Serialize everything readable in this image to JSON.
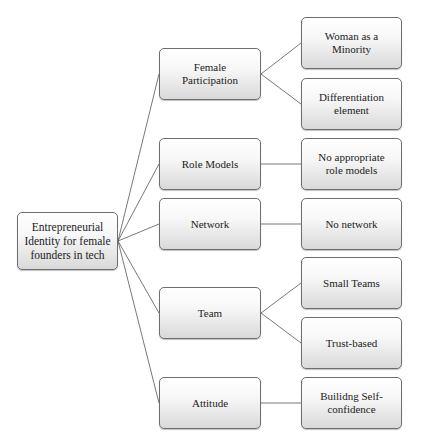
{
  "diagram": {
    "type": "tree",
    "root": {
      "label": "Entrepreneurial Identity for female founders in tech"
    },
    "branches": [
      {
        "label": "Female Participation",
        "children": [
          "Woman as a Minority",
          "Differentiation element"
        ]
      },
      {
        "label": "Role Models",
        "children": [
          "No appropriate role models"
        ]
      },
      {
        "label": "Network",
        "children": [
          "No network"
        ]
      },
      {
        "label": "Team",
        "children": [
          "Small Teams",
          "Trust-based"
        ]
      },
      {
        "label": "Attitude",
        "children": [
          "Builidng Self-confidence"
        ]
      }
    ],
    "colors": {
      "line": "#555555",
      "border": "#6e6e6e",
      "fill_top": "#ffffff",
      "fill_bottom": "#d9d9d9"
    }
  }
}
